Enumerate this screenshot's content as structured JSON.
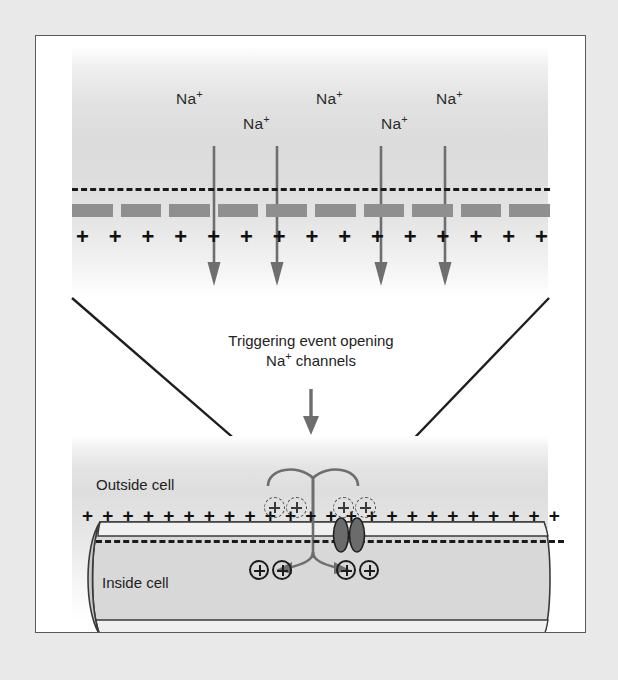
{
  "figure": {
    "background_color": "#e9e9e9",
    "panel_background": "#ffffff",
    "border_color": "#5a5a5a"
  },
  "top_panel": {
    "description": "Magnified view of membrane with sodium ions entering",
    "na_labels": [
      {
        "text": "Na",
        "sup": "+",
        "x": 140,
        "y": 62
      },
      {
        "text": "Na",
        "sup": "+",
        "x": 208,
        "y": 87
      },
      {
        "text": "Na",
        "sup": "+",
        "x": 317,
        "y": 62
      },
      {
        "text": "Na",
        "sup": "+",
        "x": 370,
        "y": 87
      },
      {
        "text": "Na",
        "sup": "+",
        "x": 432,
        "y": 62
      }
    ],
    "na_label_extra": {
      "text": "Na",
      "sup": "+",
      "x": 276,
      "y": 62
    },
    "plus_count": 15,
    "plus_symbol": "+",
    "membrane_color": "#8f8f8f",
    "arrow_color": "#6e6e6e",
    "dash_line_color": "#1a1a1a",
    "arrow_x_positions": [
      176,
      240,
      344,
      408
    ],
    "arrow_top": 112,
    "arrow_bottom": 248
  },
  "trigger": {
    "line1": "Triggering event opening",
    "line2_prefix": "Na",
    "line2_sup": "+",
    "line2_suffix": " channels",
    "arrow_color": "#6e6e6e"
  },
  "bottom_panel": {
    "outside_label": "Outside cell",
    "inside_label": "Inside cell",
    "plus_count": 24,
    "plus_symbol": "+",
    "outside_ions": [
      {
        "label": "+",
        "x": 264,
        "y": 466
      },
      {
        "label": "+",
        "x": 285,
        "y": 466
      },
      {
        "label": "+",
        "x": 330,
        "y": 466
      },
      {
        "label": "+",
        "x": 351,
        "y": 466
      }
    ],
    "inside_ions": [
      {
        "label": "+",
        "x": 250,
        "y": 528
      },
      {
        "label": "+",
        "x": 272,
        "y": 528
      },
      {
        "label": "+",
        "x": 330,
        "y": 528
      },
      {
        "label": "+",
        "x": 352,
        "y": 528
      }
    ],
    "channel": {
      "name": "sodium-channel-protein",
      "fill": "#6b6b6b",
      "stroke": "#1f1f1f"
    },
    "cell_fill": "#d9d9d9",
    "cell_stroke": "#3a3a3a"
  },
  "colors": {
    "membrane_gray": "#8f8f8f",
    "arrow_gray": "#6e6e6e",
    "ion_dark": "#1c1c1c",
    "text_dark": "#232323",
    "frame_border": "#5a5a5a",
    "page_background": "#e9e9e9"
  }
}
